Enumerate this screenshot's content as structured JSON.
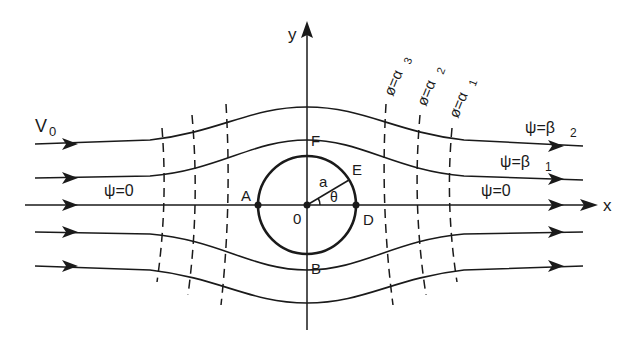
{
  "figure": {
    "colors": {
      "ink": "#1a1a1a",
      "background": "#ffffff"
    }
  },
  "axes": {
    "x_label": "x",
    "y_label": "y",
    "origin_label": "0"
  },
  "cylinder": {
    "radius_label": "a",
    "angle_label": "θ",
    "points": {
      "A": "A",
      "B": "B",
      "D": "D",
      "E": "E",
      "F": "F"
    }
  },
  "flow": {
    "freestream_label": "V",
    "freestream_subscript": "0"
  },
  "streamlines": [
    {
      "id": "psi-beta2",
      "label": "ψ=β",
      "subscript": "2"
    },
    {
      "id": "psi-beta1",
      "label": "ψ=β",
      "subscript": "1"
    },
    {
      "id": "psi-zero-left",
      "label": "ψ=0"
    },
    {
      "id": "psi-zero-right",
      "label": "ψ=0"
    }
  ],
  "equipotentials": [
    {
      "id": "phi-alpha3",
      "label": "ø=α",
      "subscript": "3"
    },
    {
      "id": "phi-alpha2",
      "label": "ø=α",
      "subscript": "2"
    },
    {
      "id": "phi-alpha1",
      "label": "ø=α",
      "subscript": "1"
    }
  ]
}
